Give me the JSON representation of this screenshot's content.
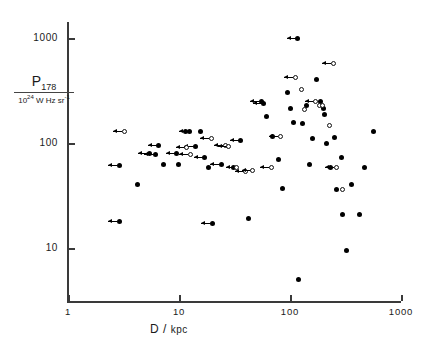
{
  "figure": {
    "kind": "scatter-plot",
    "background": "#ffffff",
    "marker_color": "#000000"
  },
  "axes": {
    "y": {
      "label_numerator": "P",
      "label_numerator_sub": "178",
      "label_denominator": "10",
      "label_denominator_rest": " W Hz  sr",
      "ticks": [
        "1000",
        "100",
        "10"
      ]
    },
    "x": {
      "label": "D /",
      "label_unit": "kpc",
      "ticks": [
        "1",
        "10",
        "100",
        "1000"
      ]
    }
  },
  "chart_data": {
    "type": "scatter",
    "title": "",
    "xlabel": "D / kpc",
    "ylabel": "P_178 / 10^24 W Hz^-1 sr^-1",
    "xscale": "log",
    "yscale": "log",
    "xlim": [
      1,
      1000
    ],
    "ylim": [
      3,
      2000
    ],
    "xtick_values": [
      1,
      10,
      100,
      1000
    ],
    "ytick_values": [
      10,
      100,
      1000
    ],
    "grid": false,
    "legend": null,
    "series": [
      {
        "name": "filled-circle",
        "marker": "filled",
        "points": [
          {
            "x": 2.9,
            "y": 61,
            "arrow": true
          },
          {
            "x": 2.9,
            "y": 18,
            "arrow": true
          },
          {
            "x": 4.2,
            "y": 40,
            "arrow": false
          },
          {
            "x": 5.4,
            "y": 80,
            "arrow": true
          },
          {
            "x": 6.1,
            "y": 78,
            "arrow": true
          },
          {
            "x": 6.6,
            "y": 95,
            "arrow": true
          },
          {
            "x": 7.2,
            "y": 63,
            "arrow": false
          },
          {
            "x": 9.5,
            "y": 80,
            "arrow": true
          },
          {
            "x": 9.8,
            "y": 62,
            "arrow": false
          },
          {
            "x": 11.5,
            "y": 130,
            "arrow": false
          },
          {
            "x": 12.5,
            "y": 130,
            "arrow": true
          },
          {
            "x": 14.0,
            "y": 92,
            "arrow": true
          },
          {
            "x": 15.5,
            "y": 128,
            "arrow": false
          },
          {
            "x": 17.0,
            "y": 72,
            "arrow": true
          },
          {
            "x": 18.5,
            "y": 58,
            "arrow": false
          },
          {
            "x": 20.0,
            "y": 17,
            "arrow": true
          },
          {
            "x": 24.0,
            "y": 62,
            "arrow": true
          },
          {
            "x": 31.0,
            "y": 58,
            "arrow": false
          },
          {
            "x": 36.0,
            "y": 105,
            "arrow": true
          },
          {
            "x": 42.0,
            "y": 19,
            "arrow": false
          },
          {
            "x": 55.0,
            "y": 250,
            "arrow": true
          },
          {
            "x": 58.0,
            "y": 240,
            "arrow": true
          },
          {
            "x": 62.0,
            "y": 180,
            "arrow": false
          },
          {
            "x": 70.0,
            "y": 115,
            "arrow": false
          },
          {
            "x": 78.0,
            "y": 70,
            "arrow": false
          },
          {
            "x": 86.0,
            "y": 37,
            "arrow": false
          },
          {
            "x": 95.0,
            "y": 300,
            "arrow": false
          },
          {
            "x": 100.0,
            "y": 215,
            "arrow": false
          },
          {
            "x": 108.0,
            "y": 158,
            "arrow": false
          },
          {
            "x": 118.0,
            "y": 1000,
            "arrow": true
          },
          {
            "x": 120.0,
            "y": 5.0,
            "arrow": false
          },
          {
            "x": 130.0,
            "y": 155,
            "arrow": false
          },
          {
            "x": 140.0,
            "y": 230,
            "arrow": false
          },
          {
            "x": 150.0,
            "y": 62,
            "arrow": false
          },
          {
            "x": 160.0,
            "y": 110,
            "arrow": false
          },
          {
            "x": 175.0,
            "y": 400,
            "arrow": false
          },
          {
            "x": 190.0,
            "y": 250,
            "arrow": false
          },
          {
            "x": 200.0,
            "y": 215,
            "arrow": false
          },
          {
            "x": 205.0,
            "y": 185,
            "arrow": false
          },
          {
            "x": 215.0,
            "y": 100,
            "arrow": false
          },
          {
            "x": 230.0,
            "y": 58,
            "arrow": false
          },
          {
            "x": 250.0,
            "y": 112,
            "arrow": false
          },
          {
            "x": 265.0,
            "y": 36,
            "arrow": false
          },
          {
            "x": 290.0,
            "y": 72,
            "arrow": false
          },
          {
            "x": 300.0,
            "y": 21,
            "arrow": false
          },
          {
            "x": 320.0,
            "y": 9.5,
            "arrow": false
          },
          {
            "x": 360.0,
            "y": 40,
            "arrow": false
          },
          {
            "x": 420.0,
            "y": 21,
            "arrow": false
          },
          {
            "x": 470.0,
            "y": 58,
            "arrow": false
          },
          {
            "x": 560.0,
            "y": 128,
            "arrow": false
          }
        ]
      },
      {
        "name": "open-circle",
        "marker": "open",
        "points": [
          {
            "x": 3.2,
            "y": 128,
            "arrow": true
          },
          {
            "x": 11.8,
            "y": 90,
            "arrow": true
          },
          {
            "x": 12.6,
            "y": 78,
            "arrow": true
          },
          {
            "x": 19.5,
            "y": 110,
            "arrow": true
          },
          {
            "x": 26.0,
            "y": 95,
            "arrow": true
          },
          {
            "x": 28.0,
            "y": 92,
            "arrow": true
          },
          {
            "x": 33.0,
            "y": 58,
            "arrow": true
          },
          {
            "x": 40.0,
            "y": 53,
            "arrow": true
          },
          {
            "x": 46.0,
            "y": 55,
            "arrow": true
          },
          {
            "x": 68.0,
            "y": 58,
            "arrow": true
          },
          {
            "x": 82.0,
            "y": 115,
            "arrow": true
          },
          {
            "x": 112.0,
            "y": 420,
            "arrow": true
          },
          {
            "x": 128.0,
            "y": 320,
            "arrow": false
          },
          {
            "x": 135.0,
            "y": 210,
            "arrow": false
          },
          {
            "x": 170.0,
            "y": 250,
            "arrow": true
          },
          {
            "x": 185.0,
            "y": 230,
            "arrow": false
          },
          {
            "x": 196.0,
            "y": 228,
            "arrow": false
          },
          {
            "x": 225.0,
            "y": 148,
            "arrow": false
          },
          {
            "x": 245.0,
            "y": 570,
            "arrow": true
          },
          {
            "x": 262.0,
            "y": 58,
            "arrow": true
          },
          {
            "x": 300.0,
            "y": 36,
            "arrow": false
          }
        ]
      }
    ]
  }
}
